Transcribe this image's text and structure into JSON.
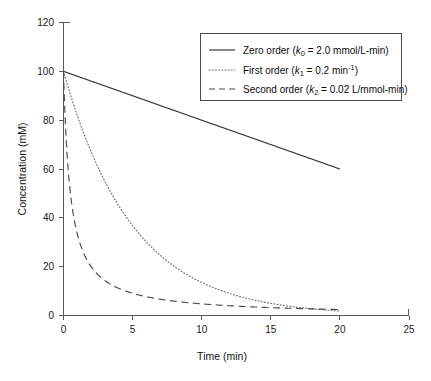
{
  "chart_data": {
    "type": "line",
    "title": "",
    "xlabel": "Time (min)",
    "ylabel": "Concentration (mM)",
    "xlim": [
      0,
      25
    ],
    "ylim": [
      0,
      120
    ],
    "xticks": [
      0,
      5,
      10,
      15,
      20,
      25
    ],
    "yticks": [
      0,
      20,
      40,
      60,
      80,
      100,
      120
    ],
    "xtick_labels": [
      "0",
      "5",
      "10",
      "15",
      "20",
      "25"
    ],
    "ytick_labels": [
      "0",
      "20",
      "40",
      "60",
      "80",
      "100",
      "120"
    ],
    "grid": false,
    "legend_position": "upper right",
    "initial_concentration": 100,
    "x": [
      0,
      0.5,
      1,
      1.5,
      2,
      2.5,
      3,
      3.5,
      4,
      4.5,
      5,
      6,
      7,
      8,
      9,
      10,
      11,
      12,
      13,
      14,
      15,
      16,
      17,
      18,
      19,
      20
    ],
    "series": [
      {
        "name": "Zero order",
        "style": "solid",
        "rate_constant": 2.0,
        "rate_constant_units": "mmol/L-min",
        "values": [
          100,
          99,
          98,
          97,
          96,
          95,
          94,
          93,
          92,
          91,
          90,
          88,
          86,
          84,
          82,
          80,
          78,
          76,
          74,
          72,
          70,
          68,
          66,
          64,
          62,
          60
        ]
      },
      {
        "name": "First order",
        "style": "dotted",
        "rate_constant": 0.2,
        "rate_constant_units": "min^-1",
        "values": [
          100,
          90.5,
          81.9,
          74.1,
          67.0,
          60.7,
          54.9,
          49.7,
          44.9,
          40.7,
          36.8,
          30.1,
          24.7,
          20.2,
          16.5,
          13.5,
          11.1,
          9.1,
          7.4,
          6.1,
          5.0,
          4.1,
          3.3,
          2.7,
          2.2,
          1.8
        ]
      },
      {
        "name": "Second order",
        "style": "dashed",
        "rate_constant": 0.02,
        "rate_constant_units": "L/mmol-min",
        "values": [
          100,
          50.0,
          33.3,
          25.0,
          20.0,
          16.7,
          14.3,
          12.5,
          11.1,
          10.0,
          9.1,
          7.7,
          6.7,
          5.9,
          5.3,
          4.8,
          4.3,
          4.0,
          3.7,
          3.4,
          3.2,
          3.0,
          2.9,
          2.7,
          2.6,
          2.4
        ]
      }
    ]
  },
  "legend": {
    "entries": [
      {
        "label_main": "Zero order (",
        "symbol": "k",
        "subscript": "0",
        "label_tail": " = 2.0 mmol/L-min)",
        "superscript": ""
      },
      {
        "label_main": "First order (",
        "symbol": "k",
        "subscript": "1",
        "label_tail": " = 0.2 min",
        "superscript": "-1",
        "label_close": ")"
      },
      {
        "label_main": "Second order (",
        "symbol": "k",
        "subscript": "2",
        "label_tail": " = 0.02 L/mmol-min)",
        "superscript": ""
      }
    ]
  },
  "axes": {
    "x_title": "Time (min)",
    "y_title": "Concentration (mM)"
  },
  "colors": {
    "background": "#ffffff",
    "axis": "#5a5a5a",
    "zero_order": "#333333",
    "first_order": "#6e6e6e",
    "second_order": "#4a4a4a",
    "text": "#111111"
  }
}
